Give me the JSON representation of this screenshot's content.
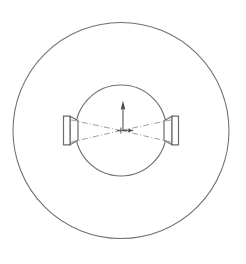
{
  "drawing": {
    "title": "Vessel plan view with opposed side nozzles",
    "view_type": "plan-view-section",
    "background_color": "#ffffff",
    "line_color": "#6f6f6f",
    "centerline_color": "#8e8e8e",
    "arrow_color": "#4a4a4a",
    "canvas": {
      "width": 246,
      "height": 264
    },
    "center": {
      "x": 121,
      "y": 130.5
    },
    "elements": {
      "outer_circle": {
        "name": "outer-shell-circle",
        "cx": 121,
        "cy": 130.5,
        "r": 108
      },
      "inner_circle": {
        "name": "inner-bore-circle",
        "cx": 121,
        "cy": 130.5,
        "r": 45.5
      },
      "left_nozzle": {
        "name": "left-nozzle",
        "neck_top_y": 120.5,
        "neck_bottom_y": 140.5,
        "taper_outer_top_y": 115.5,
        "taper_outer_bottom_y": 145.5,
        "neck_inner_x": 80,
        "neck_outer_x": 70,
        "flange_face_x": 63.5,
        "flange_top_y": 115.5,
        "flange_bottom_y": 145.5
      },
      "right_nozzle": {
        "name": "right-nozzle",
        "neck_top_y": 120.5,
        "neck_bottom_y": 140.5,
        "taper_outer_top_y": 115.5,
        "taper_outer_bottom_y": 145.5,
        "neck_inner_x": 162,
        "neck_outer_x": 172,
        "flange_face_x": 178.5,
        "flange_top_y": 115.5,
        "flange_bottom_y": 145.5
      },
      "centerlines": [
        {
          "name": "centerline-upper-left",
          "x1": 121,
          "y1": 130.5,
          "x2": 69,
          "y2": 119.5
        },
        {
          "name": "centerline-lower-left",
          "x1": 121,
          "y1": 130.5,
          "x2": 69,
          "y2": 142.5
        },
        {
          "name": "centerline-upper-right",
          "x1": 121,
          "y1": 130.5,
          "x2": 173,
          "y2": 119.5
        },
        {
          "name": "centerline-lower-right",
          "x1": 121,
          "y1": 130.5,
          "x2": 173,
          "y2": 142.5
        }
      ],
      "vertical_arrow": {
        "name": "north-direction-arrow",
        "x": 123,
        "tail_y": 131,
        "head_y": 100.5,
        "head_width": 4.6,
        "head_length": 8
      },
      "center_arrow": {
        "name": "center-flow-arrow",
        "y": 130.5,
        "tail_x": 121,
        "head_x": 133,
        "head_width": 4.2,
        "head_length": 6
      },
      "center_mark": {
        "name": "center-cross-mark",
        "x": 121,
        "y": 130.5,
        "size": 4
      }
    }
  }
}
